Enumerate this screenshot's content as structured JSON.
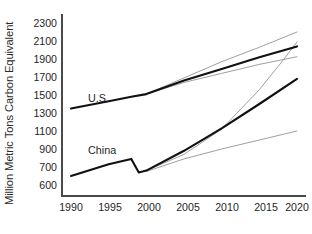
{
  "chart_data": {
    "type": "line",
    "title": "",
    "xlabel": "",
    "ylabel": "Million Metric Tons Carbon Equivalent",
    "x_tick_labels": [
      "1990",
      "1995",
      "2000",
      "2005",
      "2010",
      "2015",
      "2020"
    ],
    "y_tick_labels": [
      "2300",
      "2100",
      "1900",
      "1700",
      "1500",
      "1300",
      "1100",
      "900",
      "700",
      "600"
    ],
    "xlim": [
      1990,
      2020
    ],
    "ylim": [
      600,
      2300
    ],
    "grid": false,
    "legend": "inline-labels",
    "annotations": [
      {
        "text": "U.S.",
        "x": 1995.5,
        "y": 1620
      },
      {
        "text": "China",
        "x": 1995.2,
        "y": 960
      }
    ],
    "series": [
      {
        "name": "U.S. historical",
        "style": "thick-black",
        "x": [
          1990,
          1995,
          1998,
          2000,
          2005,
          2010,
          2015,
          2020
        ],
        "values": [
          1350,
          1430,
          1480,
          1510,
          1660,
          1790,
          1920,
          2040
        ]
      },
      {
        "name": "U.S. projection high",
        "style": "thin-gray",
        "x": [
          2000,
          2005,
          2010,
          2015,
          2020
        ],
        "values": [
          1510,
          1690,
          1870,
          2030,
          2200
        ]
      },
      {
        "name": "U.S. projection low",
        "style": "thin-gray",
        "x": [
          2000,
          2005,
          2010,
          2015,
          2020
        ],
        "values": [
          1510,
          1640,
          1740,
          1840,
          1925
        ]
      },
      {
        "name": "China historical",
        "style": "thick-black",
        "x": [
          1990,
          1995,
          1998,
          1999,
          2000,
          2005,
          2010,
          2015,
          2020
        ],
        "values": [
          650,
          730,
          790,
          670,
          680,
          880,
          1130,
          1400,
          1680
        ]
      },
      {
        "name": "China projection high",
        "style": "thin-gray",
        "x": [
          2000,
          2005,
          2010,
          2015,
          2018,
          2020
        ],
        "values": [
          680,
          840,
          1120,
          1560,
          1870,
          2090
        ]
      },
      {
        "name": "China projection low",
        "style": "thin-gray",
        "x": [
          2000,
          2005,
          2010,
          2015,
          2020
        ],
        "values": [
          675,
          790,
          900,
          1000,
          1100
        ]
      }
    ]
  },
  "colors": {
    "main_line": "#111111",
    "projection_line": "#8e8e8e",
    "axis": "#4a4a4a",
    "text": "#1f1f1f",
    "background": "#ffffff"
  }
}
